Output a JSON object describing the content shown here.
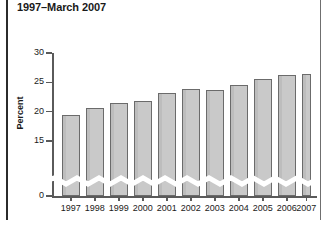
{
  "chart_data": {
    "type": "bar",
    "title": "1997–March 2007",
    "xlabel": "",
    "ylabel": "Percent",
    "categories": [
      "1997",
      "1998",
      "1999",
      "2000",
      "2001",
      "2002",
      "2003",
      "2004",
      "2005",
      "2006",
      "2007"
    ],
    "values": [
      19.5,
      20.6,
      21.5,
      21.8,
      23.1,
      23.9,
      23.7,
      24.6,
      25.5,
      26.3,
      26.5
    ],
    "ylim": [
      15,
      30
    ],
    "y_ticks": [
      "0",
      "15",
      "20",
      "25",
      "30"
    ],
    "y_tick_values": [
      0,
      15,
      20,
      25,
      30
    ],
    "axis_break": true,
    "axis_break_note": "y-axis broken between 0 and 15",
    "grid": false,
    "legend": null,
    "bar_fill_color": "#c9c9c9",
    "bar_edge_color": "#6b6b6b",
    "axis_color": "#5a5a5a",
    "text_color": "#1a1a1a",
    "partial_year_category": "2007",
    "partial_year_note": "2007 bar covers January–March only and is drawn narrower"
  }
}
